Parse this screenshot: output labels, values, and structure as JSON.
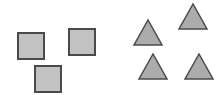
{
  "canvas": {
    "width": 220,
    "height": 95,
    "background": "#ffffff"
  },
  "colors": {
    "stroke": "#4a4a4a",
    "square_fill": "#c2c2c2",
    "triangle_fill": "#acacac"
  },
  "squares": [
    {
      "x": 18,
      "y": 33,
      "size": 26
    },
    {
      "x": 69,
      "y": 29,
      "size": 26
    },
    {
      "x": 35,
      "y": 66,
      "size": 26
    }
  ],
  "triangles": [
    {
      "points": "148,20 134,45 162,45"
    },
    {
      "points": "193,4 179,29 207,29"
    },
    {
      "points": "153,54 139,79 167,79"
    },
    {
      "points": "199,54 185,79 213,79"
    }
  ]
}
